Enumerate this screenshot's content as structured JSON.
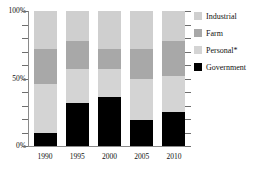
{
  "chart_data": {
    "type": "bar",
    "subtype": "stacked-percentage",
    "title": "",
    "xlabel": "",
    "ylabel": "",
    "categories": [
      "1990",
      "1995",
      "2000",
      "2005",
      "2010"
    ],
    "ylim": [
      0,
      100
    ],
    "y_tick_labels": [
      "0%",
      "50%",
      "100%"
    ],
    "y_major_ticks": [
      0,
      50,
      100
    ],
    "y_minor_tick_interval": 10,
    "grid": false,
    "legend_position": "right",
    "value_unit": "percent",
    "series": [
      {
        "name": "Government",
        "color": "#000000",
        "values": [
          10,
          32,
          36,
          19,
          25
        ]
      },
      {
        "name": "Personal*",
        "color": "#d4d4d4",
        "values": [
          36,
          25,
          21,
          31,
          27
        ]
      },
      {
        "name": "Farm",
        "color": "#a8a8a8",
        "values": [
          26,
          21,
          15,
          22,
          26
        ]
      },
      {
        "name": "Industrial",
        "color": "#cfcfcf",
        "values": [
          28,
          22,
          28,
          28,
          22
        ]
      }
    ],
    "stack_order_bottom_to_top": [
      "Government",
      "Personal*",
      "Farm",
      "Industrial"
    ]
  },
  "legend": {
    "items": [
      {
        "label": "Industrial",
        "color": "#cfcfcf"
      },
      {
        "label": "Farm",
        "color": "#a8a8a8"
      },
      {
        "label": "Personal*",
        "color": "#d4d4d4"
      },
      {
        "label": "Government",
        "color": "#000000"
      }
    ]
  },
  "axes": {
    "y": {
      "labels": [
        {
          "text": "100%",
          "value": 100
        },
        {
          "text": "50%",
          "value": 50
        },
        {
          "text": "0%",
          "value": 0
        }
      ]
    },
    "x": {
      "labels": [
        "1990",
        "1995",
        "2000",
        "2005",
        "2010"
      ]
    }
  },
  "colors": {
    "industrial": "#cfcfcf",
    "farm": "#a8a8a8",
    "personal": "#d4d4d4",
    "government": "#000000",
    "axis": "#8a8a8a",
    "text": "#111111",
    "background": "#ffffff"
  }
}
